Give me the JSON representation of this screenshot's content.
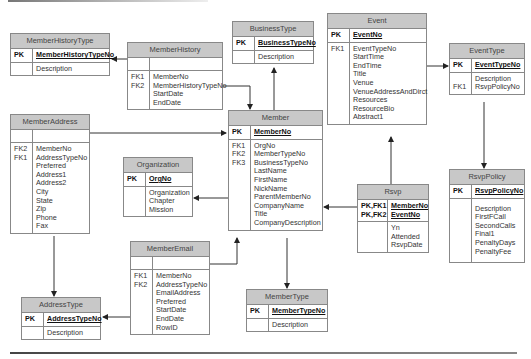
{
  "diagram": {
    "type": "entity-relationship",
    "entities": {
      "member_history_type": {
        "name": "MemberHistoryType",
        "pk_label": "PK",
        "pk": [
          "MemberHistoryTypeNo"
        ],
        "attr_keys": [
          ""
        ],
        "attrs": [
          "Description"
        ]
      },
      "member_history": {
        "name": "MemberHistory",
        "pk_label": "",
        "pk": [
          ""
        ],
        "attr_keys": [
          "FK1",
          "FK2",
          "",
          ""
        ],
        "attrs": [
          "MemberNo",
          "MemberHistoryTypeNo",
          "StartDate",
          "EndDate"
        ]
      },
      "business_type": {
        "name": "BusinessType",
        "pk_label": "PK",
        "pk": [
          "BusinessTypeNo"
        ],
        "attr_keys": [
          ""
        ],
        "attrs": [
          "Description"
        ]
      },
      "event": {
        "name": "Event",
        "pk_label": "PK",
        "pk": [
          "EventNo"
        ],
        "attr_keys": [
          "FK1",
          "",
          "",
          "",
          "",
          "",
          "",
          "",
          ""
        ],
        "attrs": [
          "EventTypeNo",
          "StartTime",
          "EndTime",
          "Title",
          "Venue",
          "VenueAddressAndDirct",
          "Resources",
          "ResourceBio",
          "Abstract1"
        ]
      },
      "event_type": {
        "name": "EventType",
        "pk_label": "PK",
        "pk": [
          "EventTypeNo"
        ],
        "attr_keys": [
          "",
          "FK1"
        ],
        "attrs": [
          "Description",
          "RsvpPolicyNo"
        ]
      },
      "member_address": {
        "name": "MemberAddress",
        "pk_label": "",
        "pk": [
          ""
        ],
        "attr_keys": [
          "FK2",
          "FK1",
          "",
          "",
          "",
          "",
          "",
          "",
          "",
          ""
        ],
        "attrs": [
          "MemberNo",
          "AddressTypeNo",
          "Preferred",
          "Address1",
          "Address2",
          "City",
          "State",
          "Zip",
          "Phone",
          "Fax"
        ]
      },
      "member": {
        "name": "Member",
        "pk_label": "PK",
        "pk": [
          "MemberNo"
        ],
        "attr_keys": [
          "FK1",
          "FK2",
          "FK3",
          "",
          "",
          "",
          "",
          "",
          "",
          ""
        ],
        "attrs": [
          "OrgNo",
          "MemberTypeNo",
          "BusinessTypeNo",
          "LastName",
          "FirstName",
          "NickName",
          "ParentMemberNo",
          "CompanyName",
          "Title",
          "CompanyDescription"
        ]
      },
      "organization": {
        "name": "Organization",
        "pk_label": "PK",
        "pk": [
          "OrgNo"
        ],
        "attr_keys": [
          "",
          "",
          ""
        ],
        "attrs": [
          "Organization",
          "Chapter",
          "Mission"
        ]
      },
      "rsvp": {
        "name": "Rsvp",
        "pk_keys": [
          "PK,FK1",
          "PK,FK2"
        ],
        "pk": [
          "MemberNo",
          "EventNo"
        ],
        "attr_keys": [
          "",
          "",
          ""
        ],
        "attrs": [
          "Yn",
          "Attended",
          "RsvpDate"
        ]
      },
      "rsvp_policy": {
        "name": "RsvpPolicy",
        "pk_label": "PK",
        "pk": [
          "RsvpPolicyNo"
        ],
        "attr_keys": [
          "",
          "",
          "",
          "",
          "",
          ""
        ],
        "attrs": [
          "Description",
          "FirstFCall",
          "SecondCalls",
          "Final1",
          "PenaltyDays",
          "PenaltyFee"
        ]
      },
      "member_email": {
        "name": "MemberEmail",
        "pk_label": "",
        "pk": [
          ""
        ],
        "attr_keys": [
          "FK1",
          "FK2",
          "",
          "",
          "",
          "",
          ""
        ],
        "attrs": [
          "MemberNo",
          "AddressTypeNo",
          "EmailAddress",
          "Preferred",
          "StartDate",
          "EndDate",
          "RowID"
        ]
      },
      "address_type": {
        "name": "AddressType",
        "pk_label": "PK",
        "pk": [
          "AddressTypeNo"
        ],
        "attr_keys": [
          ""
        ],
        "attrs": [
          "Description"
        ]
      },
      "member_type": {
        "name": "MemberType",
        "pk_label": "PK",
        "pk": [
          "MemberTypeNo"
        ],
        "attr_keys": [
          ""
        ],
        "attrs": [
          "Description"
        ]
      }
    },
    "relationships": [
      {
        "from": "MemberHistory",
        "to": "MemberHistoryType"
      },
      {
        "from": "MemberHistory",
        "to": "Member"
      },
      {
        "from": "Member",
        "to": "BusinessType"
      },
      {
        "from": "MemberAddress",
        "to": "Member"
      },
      {
        "from": "MemberAddress",
        "to": "AddressType"
      },
      {
        "from": "Member",
        "to": "Organization"
      },
      {
        "from": "Member",
        "to": "MemberType"
      },
      {
        "from": "Rsvp",
        "to": "Member"
      },
      {
        "from": "Rsvp",
        "to": "Event"
      },
      {
        "from": "Event",
        "to": "EventType"
      },
      {
        "from": "EventType",
        "to": "RsvpPolicy"
      },
      {
        "from": "MemberEmail",
        "to": "Member"
      },
      {
        "from": "MemberEmail",
        "to": "AddressType"
      }
    ],
    "colors": {
      "header_fill": "#c8c8c8",
      "border": "#888888",
      "line": "#333333"
    }
  }
}
